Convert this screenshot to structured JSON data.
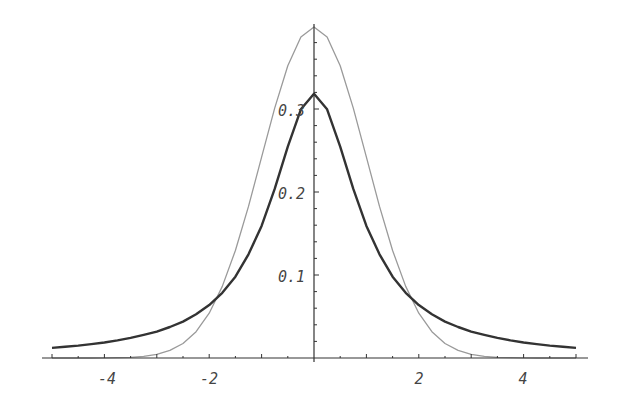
{
  "chart_data": {
    "type": "line",
    "title": "",
    "xlabel": "",
    "ylabel": "",
    "xlim": [
      -5,
      5
    ],
    "ylim": [
      0,
      0.4
    ],
    "grid": false,
    "legend": "none",
    "x_ticks": [
      -4,
      -2,
      2,
      4
    ],
    "x_tick_labels": [
      "-4",
      "-2",
      "2",
      "4"
    ],
    "y_ticks": [
      0.1,
      0.2,
      0.3
    ],
    "y_tick_labels": [
      "0.1",
      "0.2",
      "0.3"
    ],
    "x": [
      -5,
      -4.75,
      -4.5,
      -4.25,
      -4,
      -3.75,
      -3.5,
      -3.25,
      -3,
      -2.75,
      -2.5,
      -2.25,
      -2,
      -1.75,
      -1.5,
      -1.25,
      -1,
      -0.75,
      -0.5,
      -0.25,
      0,
      0.25,
      0.5,
      0.75,
      1,
      1.25,
      1.5,
      1.75,
      2,
      2.25,
      2.5,
      2.75,
      3,
      3.25,
      3.5,
      3.75,
      4,
      4.25,
      4.5,
      4.75,
      5
    ],
    "series": [
      {
        "name": "Cauchy density (dark)",
        "color": "#333333",
        "width": 2.4,
        "values": [
          0.0122,
          0.0135,
          0.015,
          0.0167,
          0.0187,
          0.0212,
          0.0242,
          0.0278,
          0.0318,
          0.0373,
          0.0439,
          0.0527,
          0.0637,
          0.0785,
          0.0979,
          0.125,
          0.1592,
          0.2037,
          0.2546,
          0.2996,
          0.3183,
          0.2996,
          0.2546,
          0.2037,
          0.1592,
          0.125,
          0.0979,
          0.0785,
          0.0637,
          0.0527,
          0.0439,
          0.0373,
          0.0318,
          0.0278,
          0.0242,
          0.0212,
          0.0187,
          0.0167,
          0.015,
          0.0135,
          0.0122
        ]
      },
      {
        "name": "Normal density (gray)",
        "color": "#9a9a9a",
        "width": 1.3,
        "values": [
          0.0,
          0.0,
          0.0,
          0.0,
          0.0001,
          0.0004,
          0.0009,
          0.002,
          0.0044,
          0.0091,
          0.0175,
          0.0317,
          0.054,
          0.0863,
          0.1295,
          0.1826,
          0.242,
          0.3011,
          0.3521,
          0.3867,
          0.3989,
          0.3867,
          0.3521,
          0.3011,
          0.242,
          0.1826,
          0.1295,
          0.0863,
          0.054,
          0.0317,
          0.0175,
          0.0091,
          0.0044,
          0.002,
          0.0009,
          0.0004,
          0.0001,
          0.0,
          0.0,
          0.0,
          0.0
        ]
      }
    ]
  },
  "axes": {
    "x_labels": [
      "-4",
      "-2",
      "2",
      "4"
    ],
    "y_labels": [
      "0.1",
      "0.2",
      "0.3"
    ]
  }
}
